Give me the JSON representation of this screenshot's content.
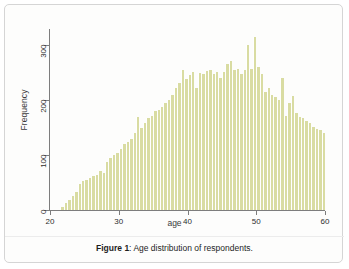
{
  "figure": {
    "caption_label": "Figure 1",
    "caption_separator": ": ",
    "caption_text": "Age distribution of respondents.",
    "border_color": "#d5d5d5",
    "background": "#fdfdfc"
  },
  "chart_data": {
    "type": "bar",
    "title": "",
    "subtitle": "",
    "xlabel": "age",
    "ylabel": "Frequency",
    "xlim": [
      20,
      60
    ],
    "ylim": [
      0,
      330
    ],
    "xticks": [
      20,
      30,
      40,
      50,
      60
    ],
    "yticks": [
      0,
      100,
      200,
      300
    ],
    "grid": false,
    "legend": null,
    "bar_color": "#d9dca2",
    "bin_width": 0.5,
    "categories": [
      21.5,
      22,
      22.5,
      23,
      23.5,
      24,
      24.5,
      25,
      25.5,
      26,
      26.5,
      27,
      27.5,
      28,
      28.5,
      29,
      29.5,
      30,
      30.5,
      31,
      31.5,
      32,
      32.5,
      33,
      33.5,
      34,
      34.5,
      35,
      35.5,
      36,
      36.5,
      37,
      37.5,
      38,
      38.5,
      39,
      39.5,
      40,
      40.5,
      41,
      41.5,
      42,
      42.5,
      43,
      43.5,
      44,
      44.5,
      45,
      45.5,
      46,
      46.5,
      47,
      47.5,
      48,
      48.5,
      49,
      49.5,
      50,
      50.5,
      51,
      51.5,
      52,
      52.5,
      53,
      53.5,
      54,
      54.5,
      55,
      55.5,
      56,
      56.5,
      57,
      57.5,
      58,
      58.5,
      59,
      59.5
    ],
    "values": [
      6,
      12,
      18,
      25,
      32,
      47,
      52,
      55,
      58,
      62,
      64,
      72,
      68,
      88,
      95,
      100,
      104,
      112,
      120,
      124,
      130,
      140,
      170,
      150,
      158,
      168,
      172,
      180,
      182,
      188,
      196,
      200,
      210,
      222,
      232,
      255,
      238,
      246,
      252,
      222,
      250,
      248,
      254,
      255,
      248,
      252,
      240,
      252,
      266,
      272,
      256,
      258,
      248,
      256,
      300,
      258,
      316,
      260,
      248,
      215,
      222,
      210,
      206,
      200,
      240,
      172,
      196,
      208,
      176,
      170,
      168,
      162,
      158,
      152,
      148,
      146,
      140
    ],
    "shape_description": "Right-skewed-to-left unimodal histogram rising from near 0 at age 22 to a peak around 315 near age 50-51, then declining to about 140 by age 60."
  },
  "axes": {
    "y_tick_labels": [
      "0",
      "100",
      "200",
      "300"
    ],
    "x_tick_labels": [
      "20",
      "30",
      "40",
      "50",
      "60"
    ]
  }
}
